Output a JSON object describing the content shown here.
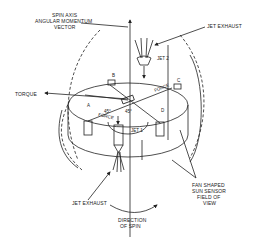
{
  "diagram": {
    "labels": {
      "spin_axis_line1": "SPIN AXIS",
      "spin_axis_line2": "ANGULAR MOMENTUM",
      "spin_axis_line3": "VECTOR",
      "jet_exhaust_top": "JET EXHAUST",
      "jet2": "JET 2",
      "torque": "TORQUE",
      "jet1": "JET 1",
      "force_top": "FORCE",
      "force_bottom": "FORCE",
      "angle_left": "45°",
      "angle_right": "45°",
      "point_a": "A",
      "point_b": "B",
      "point_c": "C",
      "point_d": "D",
      "jet_exhaust_bottom": "JET EXHAUST",
      "sensor_line1": "FAN SHAPED",
      "sensor_line2": "SUN SENSOR",
      "sensor_line3": "FIELD OF",
      "sensor_line4": "VIEW",
      "direction_line1": "DIRECTION",
      "direction_line2": "OF SPIN"
    }
  }
}
